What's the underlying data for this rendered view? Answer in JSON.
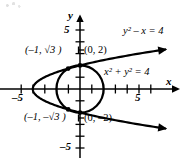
{
  "figure": {
    "kind": "coordinate-plane-graph",
    "background": "#ffffff",
    "ink_color": "#000000"
  },
  "axes": {
    "x_label": "x",
    "y_label": "y",
    "x_range": [
      -6.8,
      8.6
    ],
    "y_range": [
      -5.9,
      6.7
    ],
    "origin_px": [
      80,
      89
    ],
    "unit_px": 11.8,
    "tick_step": 1,
    "x_tick_labels": [
      {
        "value": -5,
        "text": "–5"
      },
      {
        "value": 5,
        "text": "5"
      }
    ],
    "y_tick_labels": [
      {
        "value": 5,
        "text": "5"
      },
      {
        "value": -5,
        "text": "–5"
      }
    ],
    "grid": false
  },
  "chart_data": {
    "type": "line",
    "title": "",
    "xlabel": "x",
    "ylabel": "y",
    "xlim": [
      -6.8,
      8.6
    ],
    "ylim": [
      -5.9,
      6.7
    ],
    "grid": false,
    "series": [
      {
        "name": "circle",
        "equation": "x^2 + y^2 = 4",
        "equation_display": "x² + y² = 4",
        "shape": "circle",
        "center": [
          0,
          0
        ],
        "radius": 2
      },
      {
        "name": "parabola",
        "equation": "y^2 - x = 4",
        "equation_display": "y² − x = 4",
        "shape": "parabola",
        "opens": "right",
        "vertex": [
          -4,
          0
        ],
        "arrowheads": [
          "upper-right",
          "lower-right"
        ]
      }
    ],
    "intersections": [
      {
        "x": -1,
        "y": 1.7320508,
        "label": "(–1, √3)"
      },
      {
        "x": 0,
        "y": 2,
        "label": "(0, 2)"
      },
      {
        "x": 0,
        "y": -2,
        "label": "(0, –2)"
      },
      {
        "x": -1,
        "y": -1.7320508,
        "label": "(–1, −√3)"
      }
    ]
  },
  "labels": {
    "eq_parabola": {
      "base": "y",
      "exp": "2",
      "rest": " – x = 4",
      "text": "y² – x = 4"
    },
    "eq_circle": {
      "b1": "x",
      "e1": "2",
      "mid": " + ",
      "b2": "y",
      "e2": "2",
      "rest": " = 4",
      "text": "x² + y² = 4"
    },
    "pt_upper_left": {
      "open": "(–1, ",
      "radical": "3",
      "close": " )",
      "text": "(–1, √3 )"
    },
    "pt_lower_left": {
      "open": "(–1, –",
      "radical": "3",
      "close": " )",
      "text": "(–1, –√3 )"
    },
    "pt_top": {
      "text": "(0, 2)"
    },
    "pt_bottom": {
      "text": "(0, –2)"
    },
    "x_neg5": {
      "text": "–5"
    },
    "x_pos5": {
      "text": "5"
    },
    "y_pos5": {
      "text": "5"
    },
    "y_neg5": {
      "text": "–5"
    },
    "axis_x": {
      "text": "x"
    },
    "axis_y": {
      "text": "y"
    }
  }
}
